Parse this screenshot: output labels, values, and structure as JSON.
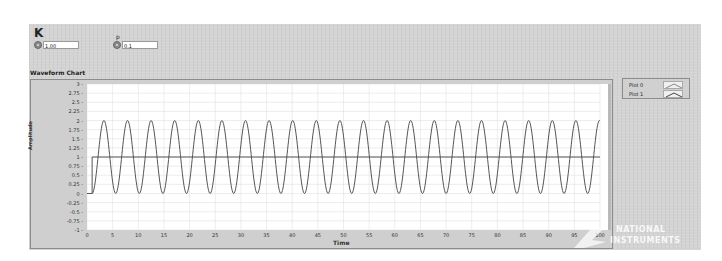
{
  "front_panel": {
    "controls": [
      {
        "label": "K",
        "value": "1.00",
        "type": "numeric"
      },
      {
        "label": "p",
        "value": "0.1",
        "type": "numeric"
      }
    ]
  },
  "chart": {
    "label": "Waveform Chart",
    "x_axis_label": "Time",
    "y_axis_label": "Amplitude",
    "legend": [
      {
        "name": "Plot 0"
      },
      {
        "name": "Plot 1"
      }
    ],
    "y_ticks": [
      "3",
      "2.75",
      "2.5",
      "2.25",
      "2",
      "1.75",
      "1.5",
      "1.25",
      "1",
      "0.75",
      "0.5",
      "0.25",
      "0",
      "-0.25",
      "-0.5",
      "-0.75",
      "-1"
    ],
    "x_ticks": [
      "0",
      "5",
      "10",
      "15",
      "20",
      "25",
      "30",
      "35",
      "40",
      "45",
      "50",
      "55",
      "60",
      "65",
      "70",
      "75",
      "80",
      "85",
      "90",
      "95",
      "100"
    ],
    "x_end_label": "100"
  },
  "watermark": {
    "line1": "NATIONAL",
    "line2": "INSTRUMENTS"
  },
  "colors": {
    "panel_bg": "#d3d3d3",
    "plot_bg": "#ffffff",
    "trace": "#555555",
    "grid": "#e0e0e0"
  },
  "chart_data": {
    "type": "line",
    "title": "Waveform Chart",
    "xlabel": "Time",
    "ylabel": "Amplitude",
    "xlim": [
      0,
      100
    ],
    "ylim": [
      -1,
      3
    ],
    "grid": true,
    "legend_position": "right-top",
    "series": [
      {
        "name": "Plot 0",
        "description": "step input: 0 for t<1, then 1",
        "x": [
          0,
          1,
          1,
          100
        ],
        "y": [
          0,
          0,
          1,
          1
        ]
      },
      {
        "name": "Plot 1",
        "description": "oscillation 1 - cos(w(t-1)) between 0 and 2, ~22 cycles over 0-100",
        "min": 0,
        "max": 2,
        "mean": 1,
        "period": 4.6,
        "start_time": 1
      }
    ]
  }
}
